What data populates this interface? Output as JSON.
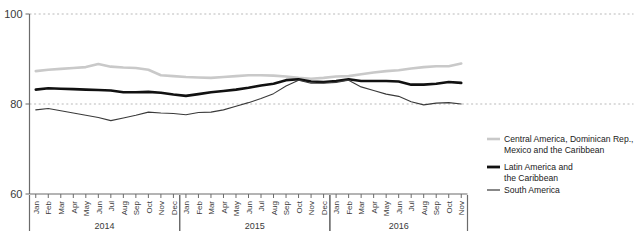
{
  "chart_data": {
    "type": "line",
    "title": "",
    "xlabel": "",
    "ylabel": "",
    "ylim": [
      60,
      100
    ],
    "yticks": [
      60,
      80,
      100
    ],
    "ytick_labels": [
      "60",
      "80",
      "100"
    ],
    "grid": "horizontal-dotted",
    "legend_position": "right",
    "x": [
      "Jan 2014",
      "Feb 2014",
      "Mar 2014",
      "Apr 2014",
      "May 2014",
      "Jun 2014",
      "Jul 2014",
      "Aug 2014",
      "Sep 2014",
      "Oct 2014",
      "Nov 2014",
      "Dec 2014",
      "Jan 2015",
      "Feb 2015",
      "Mar 2015",
      "Apr 2015",
      "May 2015",
      "Jun 2015",
      "Jul 2015",
      "Aug 2015",
      "Sep 2015",
      "Oct 2015",
      "Nov 2015",
      "Dec 2015",
      "Jan 2016",
      "Feb 2016",
      "Mar 2016",
      "Apr 2016",
      "May 2016",
      "Jun 2016",
      "Jul 2016",
      "Aug 2016",
      "Sep 2016",
      "Oct 2016",
      "Nov 2016"
    ],
    "month_labels": [
      "Jan",
      "Feb",
      "Mar",
      "Apr",
      "May",
      "Jun",
      "Jul",
      "Aug",
      "Sep",
      "Oct",
      "Nov",
      "Dec",
      "Jan",
      "Feb",
      "Mar",
      "Apr",
      "May",
      "Jun",
      "Jul",
      "Aug",
      "Sep",
      "Oct",
      "Nov",
      "Dec",
      "Jan",
      "Feb",
      "Mar",
      "Apr",
      "May",
      "Jun",
      "Jul",
      "Aug",
      "Sep",
      "Oct",
      "Nov"
    ],
    "year_groups": [
      {
        "label": "2014",
        "start_index": 0,
        "end_index": 11
      },
      {
        "label": "2015",
        "start_index": 12,
        "end_index": 23
      },
      {
        "label": "2016",
        "start_index": 24,
        "end_index": 34
      }
    ],
    "series": [
      {
        "name": "Central America, Dominican Rep., Mexico and the Caribbean",
        "color": "#c9c9c9",
        "width": 2.6,
        "values": [
          87.3,
          87.6,
          87.8,
          88.0,
          88.2,
          88.9,
          88.3,
          88.1,
          88.0,
          87.6,
          86.4,
          86.2,
          86.0,
          85.9,
          85.8,
          86.0,
          86.2,
          86.4,
          86.4,
          86.3,
          86.1,
          85.8,
          85.6,
          85.8,
          86.1,
          86.2,
          86.6,
          87.0,
          87.3,
          87.5,
          87.9,
          88.2,
          88.4,
          88.4,
          89.0
        ]
      },
      {
        "name": "Latin America and the Caribbean",
        "color": "#111111",
        "width": 2.6,
        "values": [
          83.2,
          83.5,
          83.4,
          83.3,
          83.2,
          83.1,
          83.0,
          82.6,
          82.6,
          82.7,
          82.5,
          82.1,
          81.8,
          82.2,
          82.6,
          82.9,
          83.2,
          83.6,
          84.1,
          84.5,
          85.3,
          85.5,
          85.0,
          84.9,
          85.1,
          85.5,
          85.1,
          85.1,
          85.1,
          85.0,
          84.3,
          84.3,
          84.5,
          84.9,
          84.7
        ]
      },
      {
        "name": "South America",
        "color": "#3a3a3a",
        "width": 1.1,
        "values": [
          78.7,
          79.0,
          78.5,
          78.0,
          77.5,
          77.0,
          76.3,
          76.9,
          77.5,
          78.2,
          78.0,
          77.9,
          77.6,
          78.1,
          78.2,
          78.7,
          79.5,
          80.3,
          81.2,
          82.3,
          84.0,
          85.3,
          84.6,
          84.6,
          84.8,
          85.3,
          83.8,
          83.0,
          82.2,
          81.7,
          80.5,
          79.8,
          80.2,
          80.3,
          80.0
        ]
      }
    ]
  },
  "legend": {
    "items": [
      {
        "label_line1": "Central America, Dominican Rep.,",
        "label_line2": "Mexico and the Caribbean",
        "color": "#c9c9c9",
        "width": 2.6
      },
      {
        "label_line1": "Latin America and",
        "label_line2": "the Caribbean",
        "color": "#111111",
        "width": 2.8
      },
      {
        "label_line1": "South America",
        "label_line2": "",
        "color": "#3a3a3a",
        "width": 1.2
      }
    ]
  }
}
